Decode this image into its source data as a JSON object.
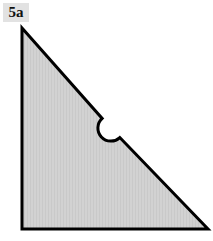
{
  "figure": {
    "label": "5a",
    "title": "",
    "background_color": "#ffffff",
    "fill_color": "#d0d0d0",
    "stroke_color": "#000000",
    "label_box_color": "#e2e2e2",
    "label_text_color": "#111111",
    "shape": {
      "type": "right-triangle-with-semicircular-notch",
      "description": "Right triangle with vertical left leg, horizontal bottom leg, and a semicircular notch cut into the hypotenuse",
      "vertices": [
        {
          "name": "apex",
          "x": 22,
          "y": 28
        },
        {
          "name": "bottom-right",
          "x": 208,
          "y": 229
        },
        {
          "name": "bottom-left",
          "x": 22,
          "y": 229
        }
      ],
      "notch": {
        "shape": "semicircle",
        "center_x": 111,
        "center_y": 128,
        "radius": 13,
        "direction": "inward"
      },
      "stroke_width": 3
    }
  }
}
